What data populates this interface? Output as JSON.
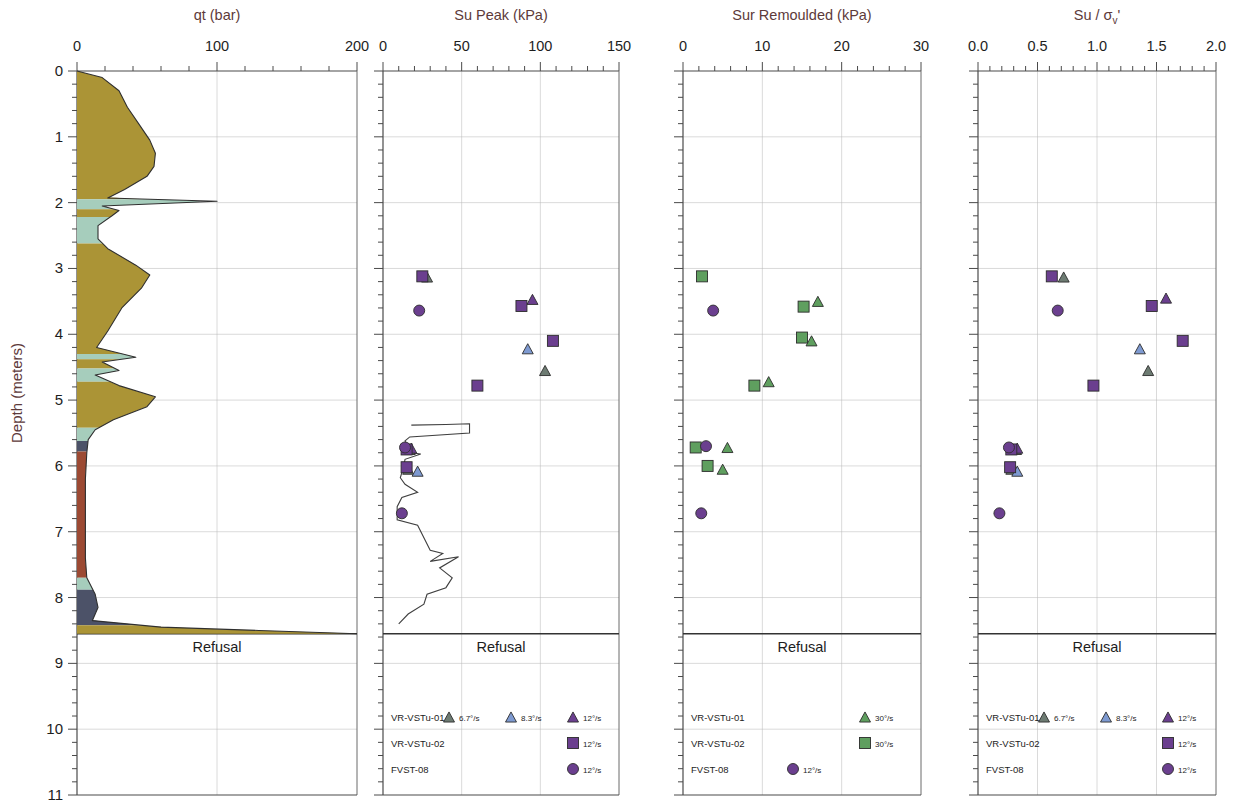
{
  "figure": {
    "y_axis_label": "Depth (meters)",
    "refusal_label": "Refusal",
    "depth_ticks": [
      "0",
      "1",
      "2",
      "3",
      "4",
      "5",
      "6",
      "7",
      "8",
      "9",
      "10",
      "11"
    ],
    "depth_min": 0,
    "depth_max": 11,
    "refusal_depth": 8.55
  },
  "panels": [
    {
      "id": "qt",
      "title": "qt (bar)",
      "x_ticks": [
        "0",
        "100",
        "200"
      ],
      "x_min": 0,
      "x_max": 200,
      "minor_per_major": 5
    },
    {
      "id": "su-peak",
      "title": "Su Peak (kPa)",
      "x_ticks": [
        "0",
        "50",
        "100",
        "150"
      ],
      "x_min": 0,
      "x_max": 150,
      "minor_per_major": 5
    },
    {
      "id": "sur-remoulded",
      "title": "Sur Remoulded (kPa)",
      "x_ticks": [
        "0",
        "10",
        "20",
        "30"
      ],
      "x_min": 0,
      "x_max": 30,
      "minor_per_major": 5
    },
    {
      "id": "su-sigma",
      "title": "Su / σᵥ'",
      "title_main": "Su / σ",
      "title_sub": "v",
      "title_prime": "'",
      "x_ticks": [
        "0.0",
        "0.5",
        "1.0",
        "1.5",
        "2.0"
      ],
      "x_min": 0,
      "x_max": 2,
      "minor_per_major": 5
    }
  ],
  "colors": {
    "soil_olive": "#ab9436",
    "soil_teal": "#a6cdbc",
    "soil_rust": "#9c4a33",
    "soil_navy": "#4c5268",
    "marker_purple": "#6b3f8f",
    "marker_blue": "#7e9ad1",
    "marker_grey": "#6d7b72",
    "marker_green": "#5f9f5f",
    "title_text": "#5d3a3a",
    "grid": "#b9b9b9"
  },
  "legends": [
    {
      "panel": "su-peak",
      "rows": [
        {
          "label": "VR-VSTu-01",
          "entries": [
            {
              "marker": "triangle",
              "color": "#6d7b72",
              "rate": "6.7°/s"
            },
            {
              "marker": "triangle",
              "color": "#7e9ad1",
              "rate": "8.3°/s"
            },
            {
              "marker": "triangle",
              "color": "#6b3f8f",
              "rate": "12°/s"
            }
          ]
        },
        {
          "label": "VR-VSTu-02",
          "entries": [
            {
              "marker": "square",
              "color": "#6b3f8f",
              "rate": "12°/s"
            }
          ]
        },
        {
          "label": "FVST-08",
          "entries": [
            {
              "marker": "circle",
              "color": "#6b3f8f",
              "rate": "12°/s"
            }
          ]
        }
      ]
    },
    {
      "panel": "sur-remoulded",
      "rows": [
        {
          "label": "VR-VSTu-01",
          "entries": [
            {
              "marker": "triangle",
              "color": "#5f9f5f",
              "rate": "30°/s"
            }
          ]
        },
        {
          "label": "VR-VSTu-02",
          "entries": [
            {
              "marker": "square",
              "color": "#5f9f5f",
              "rate": "30°/s"
            }
          ]
        },
        {
          "label": "FVST-08",
          "entries": [
            {
              "marker": "circle",
              "color": "#6b3f8f",
              "rate": "12°/s"
            }
          ]
        }
      ]
    },
    {
      "panel": "su-sigma",
      "rows": [
        {
          "label": "VR-VSTu-01",
          "entries": [
            {
              "marker": "triangle",
              "color": "#6d7b72",
              "rate": "6.7°/s"
            },
            {
              "marker": "triangle",
              "color": "#7e9ad1",
              "rate": "8.3°/s"
            },
            {
              "marker": "triangle",
              "color": "#6b3f8f",
              "rate": "12°/s"
            }
          ]
        },
        {
          "label": "VR-VSTu-02",
          "entries": [
            {
              "marker": "square",
              "color": "#6b3f8f",
              "rate": "12°/s"
            }
          ]
        },
        {
          "label": "FVST-08",
          "entries": [
            {
              "marker": "circle",
              "color": "#6b3f8f",
              "rate": "12°/s"
            }
          ]
        }
      ]
    }
  ],
  "chart_data": [
    {
      "type": "area",
      "id": "qt",
      "title": "qt (bar)",
      "xlabel": "qt (bar)",
      "ylabel": "Depth (meters)",
      "xlim": [
        0,
        200
      ],
      "ylim": [
        11,
        0
      ],
      "grid": true,
      "note": "CPT cone resistance profile, colour-banded by soil behaviour type",
      "bands": [
        {
          "from": 0.0,
          "to": 1.95,
          "color": "#ab9436"
        },
        {
          "from": 1.95,
          "to": 2.1,
          "color": "#a6cdbc"
        },
        {
          "from": 2.1,
          "to": 2.22,
          "color": "#ab9436"
        },
        {
          "from": 2.22,
          "to": 2.62,
          "color": "#a6cdbc"
        },
        {
          "from": 2.62,
          "to": 4.3,
          "color": "#ab9436"
        },
        {
          "from": 4.3,
          "to": 4.38,
          "color": "#a6cdbc"
        },
        {
          "from": 4.38,
          "to": 4.52,
          "color": "#ab9436"
        },
        {
          "from": 4.52,
          "to": 4.72,
          "color": "#a6cdbc"
        },
        {
          "from": 4.72,
          "to": 5.42,
          "color": "#ab9436"
        },
        {
          "from": 5.42,
          "to": 5.62,
          "color": "#a6cdbc"
        },
        {
          "from": 5.62,
          "to": 5.78,
          "color": "#4c5268"
        },
        {
          "from": 5.78,
          "to": 7.7,
          "color": "#9c4a33"
        },
        {
          "from": 7.7,
          "to": 7.88,
          "color": "#a6cdbc"
        },
        {
          "from": 7.88,
          "to": 8.42,
          "color": "#4c5268"
        },
        {
          "from": 8.42,
          "to": 8.55,
          "color": "#ab9436"
        }
      ],
      "profile": [
        {
          "depth": 0.0,
          "qt": 0
        },
        {
          "depth": 0.1,
          "qt": 18
        },
        {
          "depth": 0.3,
          "qt": 30
        },
        {
          "depth": 0.55,
          "qt": 36
        },
        {
          "depth": 0.8,
          "qt": 44
        },
        {
          "depth": 1.05,
          "qt": 52
        },
        {
          "depth": 1.25,
          "qt": 56
        },
        {
          "depth": 1.45,
          "qt": 55
        },
        {
          "depth": 1.6,
          "qt": 50
        },
        {
          "depth": 1.8,
          "qt": 34
        },
        {
          "depth": 1.93,
          "qt": 22
        },
        {
          "depth": 1.98,
          "qt": 100
        },
        {
          "depth": 2.05,
          "qt": 18
        },
        {
          "depth": 2.12,
          "qt": 30
        },
        {
          "depth": 2.2,
          "qt": 25
        },
        {
          "depth": 2.35,
          "qt": 15
        },
        {
          "depth": 2.55,
          "qt": 15
        },
        {
          "depth": 2.7,
          "qt": 22
        },
        {
          "depth": 2.95,
          "qt": 42
        },
        {
          "depth": 3.1,
          "qt": 52
        },
        {
          "depth": 3.3,
          "qt": 46
        },
        {
          "depth": 3.6,
          "qt": 32
        },
        {
          "depth": 3.95,
          "qt": 22
        },
        {
          "depth": 4.2,
          "qt": 14
        },
        {
          "depth": 4.35,
          "qt": 42
        },
        {
          "depth": 4.42,
          "qt": 18
        },
        {
          "depth": 4.55,
          "qt": 30
        },
        {
          "depth": 4.62,
          "qt": 13
        },
        {
          "depth": 4.78,
          "qt": 30
        },
        {
          "depth": 4.95,
          "qt": 56
        },
        {
          "depth": 5.1,
          "qt": 50
        },
        {
          "depth": 5.3,
          "qt": 26
        },
        {
          "depth": 5.45,
          "qt": 13
        },
        {
          "depth": 5.6,
          "qt": 8
        },
        {
          "depth": 5.8,
          "qt": 7
        },
        {
          "depth": 6.2,
          "qt": 6
        },
        {
          "depth": 6.8,
          "qt": 6
        },
        {
          "depth": 7.4,
          "qt": 6
        },
        {
          "depth": 7.7,
          "qt": 7
        },
        {
          "depth": 7.95,
          "qt": 13
        },
        {
          "depth": 8.15,
          "qt": 15
        },
        {
          "depth": 8.35,
          "qt": 11
        },
        {
          "depth": 8.45,
          "qt": 60
        },
        {
          "depth": 8.5,
          "qt": 130
        },
        {
          "depth": 8.55,
          "qt": 200
        }
      ]
    },
    {
      "type": "scatter",
      "id": "su-peak",
      "title": "Su Peak (kPa)",
      "xlabel": "Su Peak (kPa)",
      "ylabel": "Depth (meters)",
      "xlim": [
        0,
        150
      ],
      "ylim": [
        11,
        0
      ],
      "grid": true,
      "series": [
        {
          "name": "VR-VSTu-01 6.7°/s",
          "marker": "triangle",
          "color": "#6d7b72",
          "points": [
            {
              "x": 28,
              "depth": 3.13
            },
            {
              "x": 103,
              "depth": 4.55
            },
            {
              "x": 17,
              "depth": 5.75
            },
            {
              "x": 16,
              "depth": 6.05
            }
          ]
        },
        {
          "name": "VR-VSTu-01 8.3°/s",
          "marker": "triangle",
          "color": "#7e9ad1",
          "points": [
            {
              "x": 92,
              "depth": 4.22
            },
            {
              "x": 22,
              "depth": 6.08
            }
          ]
        },
        {
          "name": "VR-VSTu-01 12°/s",
          "marker": "triangle",
          "color": "#6b3f8f",
          "points": [
            {
              "x": 95,
              "depth": 3.47
            },
            {
              "x": 18,
              "depth": 5.73
            }
          ]
        },
        {
          "name": "VR-VSTu-02 12°/s",
          "marker": "square",
          "color": "#6b3f8f",
          "points": [
            {
              "x": 25,
              "depth": 3.12
            },
            {
              "x": 88,
              "depth": 3.57
            },
            {
              "x": 108,
              "depth": 4.1
            },
            {
              "x": 60,
              "depth": 4.78
            },
            {
              "x": 15,
              "depth": 5.75
            },
            {
              "x": 15,
              "depth": 6.02
            }
          ]
        },
        {
          "name": "FVST-08 12°/s",
          "marker": "circle",
          "color": "#6b3f8f",
          "points": [
            {
              "x": 23,
              "depth": 3.64
            },
            {
              "x": 14,
              "depth": 5.72
            },
            {
              "x": 12,
              "depth": 6.72
            }
          ]
        }
      ],
      "line_series": {
        "name": "CPT derived Su",
        "color": "#3f3f3f",
        "points": [
          {
            "x": 18,
            "depth": 5.38
          },
          {
            "x": 40,
            "depth": 5.37
          },
          {
            "x": 55,
            "depth": 5.36
          },
          {
            "x": 55,
            "depth": 5.5
          },
          {
            "x": 17,
            "depth": 5.56
          },
          {
            "x": 14,
            "depth": 5.62
          },
          {
            "x": 18,
            "depth": 5.8
          },
          {
            "x": 24,
            "depth": 5.82
          },
          {
            "x": 14,
            "depth": 5.9
          },
          {
            "x": 13,
            "depth": 6.02
          },
          {
            "x": 11,
            "depth": 6.18
          },
          {
            "x": 14,
            "depth": 6.28
          },
          {
            "x": 22,
            "depth": 6.4
          },
          {
            "x": 12,
            "depth": 6.48
          },
          {
            "x": 9,
            "depth": 6.62
          },
          {
            "x": 9,
            "depth": 6.82
          },
          {
            "x": 22,
            "depth": 6.9
          },
          {
            "x": 30,
            "depth": 7.28
          },
          {
            "x": 38,
            "depth": 7.33
          },
          {
            "x": 30,
            "depth": 7.45
          },
          {
            "x": 48,
            "depth": 7.38
          },
          {
            "x": 36,
            "depth": 7.55
          },
          {
            "x": 44,
            "depth": 7.7
          },
          {
            "x": 40,
            "depth": 7.85
          },
          {
            "x": 28,
            "depth": 7.95
          },
          {
            "x": 26,
            "depth": 8.1
          },
          {
            "x": 16,
            "depth": 8.25
          },
          {
            "x": 10,
            "depth": 8.4
          }
        ]
      }
    },
    {
      "type": "scatter",
      "id": "sur-remoulded",
      "title": "Sur Remoulded (kPa)",
      "xlabel": "Sur Remoulded (kPa)",
      "ylabel": "Depth (meters)",
      "xlim": [
        0,
        30
      ],
      "ylim": [
        11,
        0
      ],
      "grid": true,
      "series": [
        {
          "name": "VR-VSTu-01 30°/s",
          "marker": "triangle",
          "color": "#5f9f5f",
          "points": [
            {
              "x": 17.0,
              "depth": 3.5
            },
            {
              "x": 16.2,
              "depth": 4.1
            },
            {
              "x": 10.8,
              "depth": 4.72
            },
            {
              "x": 5.6,
              "depth": 5.72
            },
            {
              "x": 5.0,
              "depth": 6.05
            }
          ]
        },
        {
          "name": "VR-VSTu-02 30°/s",
          "marker": "square",
          "color": "#5f9f5f",
          "points": [
            {
              "x": 2.4,
              "depth": 3.12
            },
            {
              "x": 15.2,
              "depth": 3.58
            },
            {
              "x": 15.0,
              "depth": 4.05
            },
            {
              "x": 9.0,
              "depth": 4.78
            },
            {
              "x": 1.6,
              "depth": 5.72
            },
            {
              "x": 3.1,
              "depth": 6.0
            }
          ]
        },
        {
          "name": "FVST-08 12°/s",
          "marker": "circle",
          "color": "#6b3f8f",
          "points": [
            {
              "x": 3.8,
              "depth": 3.64
            },
            {
              "x": 2.9,
              "depth": 5.7
            },
            {
              "x": 2.3,
              "depth": 6.72
            }
          ]
        }
      ]
    },
    {
      "type": "scatter",
      "id": "su-sigma",
      "title": "Su / σv'",
      "xlabel": "Su / σv'",
      "ylabel": "Depth (meters)",
      "xlim": [
        0,
        2
      ],
      "ylim": [
        11,
        0
      ],
      "grid": true,
      "series": [
        {
          "name": "VR-VSTu-01 6.7°/s",
          "marker": "triangle",
          "color": "#6d7b72",
          "points": [
            {
              "x": 0.72,
              "depth": 3.13
            },
            {
              "x": 1.43,
              "depth": 4.55
            },
            {
              "x": 0.32,
              "depth": 5.75
            },
            {
              "x": 0.28,
              "depth": 6.05
            }
          ]
        },
        {
          "name": "VR-VSTu-01 8.3°/s",
          "marker": "triangle",
          "color": "#7e9ad1",
          "points": [
            {
              "x": 1.36,
              "depth": 4.22
            },
            {
              "x": 0.33,
              "depth": 6.08
            }
          ]
        },
        {
          "name": "VR-VSTu-01 12°/s",
          "marker": "triangle",
          "color": "#6b3f8f",
          "points": [
            {
              "x": 1.58,
              "depth": 3.45
            },
            {
              "x": 0.33,
              "depth": 5.73
            }
          ]
        },
        {
          "name": "VR-VSTu-02 12°/s",
          "marker": "square",
          "color": "#6b3f8f",
          "points": [
            {
              "x": 0.62,
              "depth": 3.12
            },
            {
              "x": 1.46,
              "depth": 3.57
            },
            {
              "x": 1.72,
              "depth": 4.1
            },
            {
              "x": 0.97,
              "depth": 4.78
            },
            {
              "x": 0.28,
              "depth": 5.75
            },
            {
              "x": 0.27,
              "depth": 6.02
            }
          ]
        },
        {
          "name": "FVST-08 12°/s",
          "marker": "circle",
          "color": "#6b3f8f",
          "points": [
            {
              "x": 0.67,
              "depth": 3.64
            },
            {
              "x": 0.26,
              "depth": 5.72
            },
            {
              "x": 0.18,
              "depth": 6.72
            }
          ]
        }
      ]
    }
  ]
}
